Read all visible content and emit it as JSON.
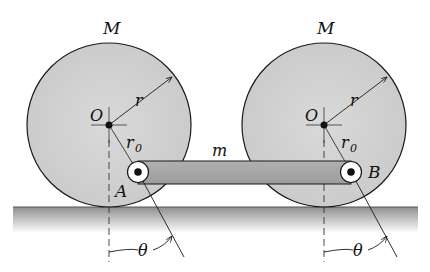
{
  "diagram": {
    "labels": {
      "mass_left": "M",
      "mass_right": "M",
      "center_left": "O",
      "center_right": "O",
      "radius_left": "r",
      "radius_right": "r",
      "offset_left": "r",
      "offset_left_sub": "0",
      "offset_right": "r",
      "offset_right_sub": "0",
      "bar_mass": "m",
      "pin_left": "A",
      "pin_right": "B",
      "angle_left": "θ",
      "angle_right": "θ"
    },
    "colors": {
      "wheel_fill": "#d2d2d2",
      "bar_fill": "#a9a9a9",
      "ground_top": "#9a9a9a",
      "stroke": "#1a1a1a"
    }
  }
}
